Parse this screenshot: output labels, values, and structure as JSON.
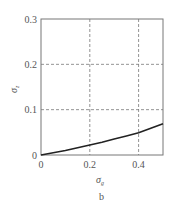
{
  "chart_data": {
    "type": "line",
    "title": "",
    "caption": "b",
    "xlabel": "σ",
    "xlabel_sub": "g",
    "ylabel": "σ",
    "ylabel_sub": "z",
    "xlim": [
      0,
      0.5
    ],
    "ylim": [
      0,
      0.3
    ],
    "xticks": [
      0,
      0.2,
      0.4
    ],
    "xtick_labels": [
      "0",
      "0.2",
      "0.4"
    ],
    "yticks": [
      0,
      0.1,
      0.2,
      0.3
    ],
    "ytick_labels": [
      "0",
      "0.1",
      "0.2",
      "0.3"
    ],
    "grid": true,
    "grid_style": "dashed",
    "legend": null,
    "series": [
      {
        "name": "curve",
        "color": "#222222",
        "x": [
          0,
          0.05,
          0.1,
          0.15,
          0.2,
          0.25,
          0.3,
          0.35,
          0.4,
          0.45,
          0.5
        ],
        "y": [
          0,
          0.005,
          0.01,
          0.016,
          0.022,
          0.028,
          0.035,
          0.042,
          0.049,
          0.059,
          0.069
        ]
      }
    ]
  }
}
